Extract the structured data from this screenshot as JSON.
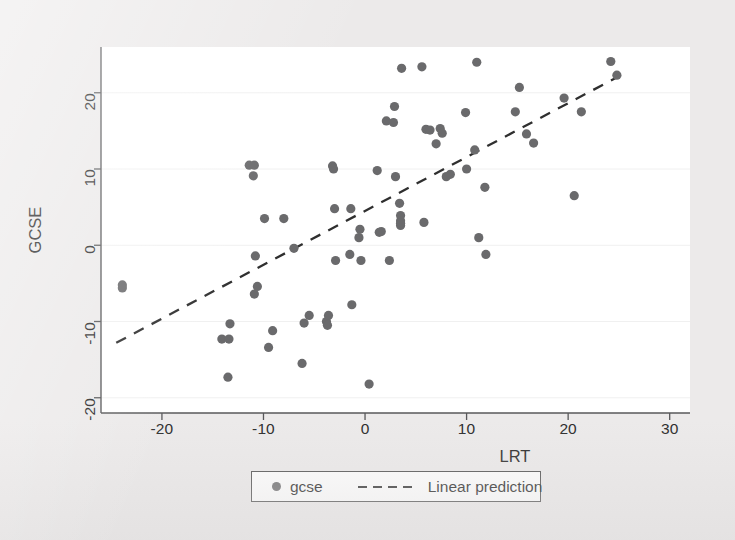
{
  "chart_data": {
    "type": "scatter",
    "title": "",
    "xlabel": "LRT",
    "ylabel": "GCSE",
    "xlim": [
      -26,
      32
    ],
    "ylim": [
      -22,
      26
    ],
    "xticks": [
      -20,
      -10,
      0,
      10,
      20,
      30
    ],
    "yticks": [
      20,
      10,
      0,
      -10,
      -20
    ],
    "xtick_labels": [
      "-20",
      "-10",
      "0",
      "10",
      "20",
      "30"
    ],
    "ytick_labels": [
      "20",
      "10",
      "0",
      "-10",
      "-20"
    ],
    "grid": "horizontal-faint",
    "legend_position": "below-axes",
    "marker_color": "#6a6a6c",
    "line_color": "#2f2f2f",
    "panel_color": "#ffffff",
    "background_color": "#eceaea",
    "series": [
      {
        "name": "gcse",
        "type": "scatter",
        "points": [
          [
            -23.9,
            -5.2
          ],
          [
            -23.9,
            -5.6
          ],
          [
            -14.1,
            -12.3
          ],
          [
            -13.4,
            -12.3
          ],
          [
            -13.5,
            -17.3
          ],
          [
            -13.3,
            -10.3
          ],
          [
            -11.4,
            10.5
          ],
          [
            -10.9,
            10.5
          ],
          [
            -11.0,
            9.1
          ],
          [
            -10.9,
            -6.4
          ],
          [
            -10.6,
            -5.4
          ],
          [
            -10.8,
            -1.4
          ],
          [
            -9.9,
            3.5
          ],
          [
            -9.5,
            -13.4
          ],
          [
            -9.1,
            -11.2
          ],
          [
            -8.0,
            3.5
          ],
          [
            -7.0,
            -0.4
          ],
          [
            -6.2,
            -15.5
          ],
          [
            -6.0,
            -10.2
          ],
          [
            -5.5,
            -9.2
          ],
          [
            -3.8,
            -10.0
          ],
          [
            -3.7,
            -10.5
          ],
          [
            -3.6,
            -9.2
          ],
          [
            -3.2,
            10.4
          ],
          [
            -3.1,
            10.0
          ],
          [
            -3.0,
            4.8
          ],
          [
            -2.9,
            -2.0
          ],
          [
            -1.5,
            -1.2
          ],
          [
            -1.4,
            4.8
          ],
          [
            -1.3,
            -7.8
          ],
          [
            -0.6,
            1.0
          ],
          [
            -0.5,
            2.1
          ],
          [
            -0.4,
            -2.0
          ],
          [
            0.4,
            -18.2
          ],
          [
            1.2,
            9.8
          ],
          [
            1.4,
            1.7
          ],
          [
            1.6,
            1.8
          ],
          [
            2.1,
            16.3
          ],
          [
            2.4,
            -2.0
          ],
          [
            2.8,
            16.1
          ],
          [
            2.9,
            18.2
          ],
          [
            3.0,
            9.0
          ],
          [
            3.4,
            5.5
          ],
          [
            3.5,
            3.9
          ],
          [
            3.5,
            3.2
          ],
          [
            3.5,
            2.6
          ],
          [
            3.5,
            2.9
          ],
          [
            3.6,
            23.2
          ],
          [
            5.6,
            23.4
          ],
          [
            5.8,
            3.0
          ],
          [
            6.0,
            15.2
          ],
          [
            6.4,
            15.1
          ],
          [
            7.0,
            13.3
          ],
          [
            7.4,
            15.3
          ],
          [
            7.6,
            14.7
          ],
          [
            8.0,
            9.0
          ],
          [
            8.4,
            9.3
          ],
          [
            9.9,
            17.4
          ],
          [
            10.0,
            10.0
          ],
          [
            10.8,
            12.5
          ],
          [
            11.0,
            24.0
          ],
          [
            11.2,
            1.0
          ],
          [
            11.8,
            7.6
          ],
          [
            11.9,
            -1.2
          ],
          [
            14.8,
            17.5
          ],
          [
            15.2,
            20.7
          ],
          [
            15.9,
            14.6
          ],
          [
            16.6,
            13.4
          ],
          [
            19.6,
            19.3
          ],
          [
            20.6,
            6.5
          ],
          [
            21.3,
            17.5
          ],
          [
            24.2,
            24.1
          ],
          [
            24.8,
            22.3
          ]
        ]
      },
      {
        "name": "Linear prediction",
        "type": "line",
        "style": "dashed",
        "endpoints": [
          [
            -24.5,
            -12.8
          ],
          [
            25.2,
            22.3
          ]
        ],
        "slope": 0.706,
        "intercept": 4.5
      }
    ]
  },
  "axes": {
    "x_title": "LRT",
    "y_title": "GCSE"
  },
  "legend": {
    "entries": [
      {
        "label": "gcse",
        "marker": "dot"
      },
      {
        "label": "Linear prediction",
        "marker": "dashed-line"
      }
    ]
  }
}
